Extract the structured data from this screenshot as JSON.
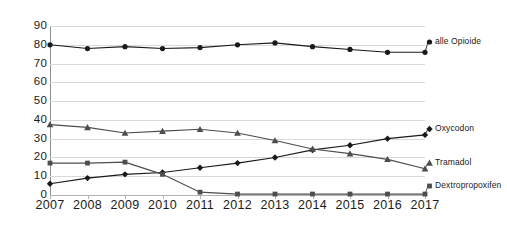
{
  "chart_data": {
    "type": "line",
    "title": "",
    "subtitle": "",
    "xlabel": "",
    "ylabel": "",
    "grid": true,
    "legend_position": "right-inline-end-of-line",
    "categories": [
      "2007",
      "2008",
      "2009",
      "2010",
      "2011",
      "2012",
      "2013",
      "2014",
      "2015",
      "2016",
      "2017"
    ],
    "x": [
      2007,
      2008,
      2009,
      2010,
      2011,
      2012,
      2013,
      2014,
      2015,
      2016,
      2017
    ],
    "xlim": [
      2007,
      2017
    ],
    "ylim": [
      0,
      90
    ],
    "yticks": [
      0,
      10,
      20,
      30,
      40,
      50,
      60,
      70,
      80,
      90
    ],
    "ytick_labels": [
      "0",
      "10",
      "20",
      "30",
      "40",
      "50",
      "60",
      "70",
      "80",
      "90"
    ],
    "series": [
      {
        "name": "alle Opioide",
        "marker": "circle",
        "color": "#1a1a1a",
        "values": [
          80,
          78,
          79,
          78,
          78.5,
          80,
          81,
          79,
          77.5,
          76,
          76
        ]
      },
      {
        "name": "Oxycodon",
        "marker": "diamond",
        "color": "#1a1a1a",
        "values": [
          6,
          9,
          11,
          12,
          14.5,
          17,
          20,
          24,
          26.5,
          30,
          32
        ]
      },
      {
        "name": "Tramadol",
        "marker": "triangle",
        "color": "#4d4d4d",
        "values": [
          37.5,
          36,
          33,
          34,
          35,
          33,
          29,
          24.5,
          22,
          19,
          14
        ]
      },
      {
        "name": "Dextropropoxifen",
        "marker": "square",
        "color": "#4d4d4d",
        "values": [
          17,
          17,
          17.5,
          11,
          1.5,
          0.5,
          0.5,
          0.5,
          0.5,
          0.5,
          0.5
        ]
      }
    ]
  },
  "legend": {
    "items": [
      {
        "label": "alle Opioide"
      },
      {
        "label": "Oxycodon"
      },
      {
        "label": "Tramadol"
      },
      {
        "label": "Dextropropoxifen"
      }
    ]
  },
  "colors": {
    "series_dark": "#1a1a1a",
    "series_mid": "#4d4d4d",
    "gridline": "#d9d9d9",
    "axis": "#8c8c8c",
    "background": "#ffffff",
    "text": "#1a1a1a"
  }
}
